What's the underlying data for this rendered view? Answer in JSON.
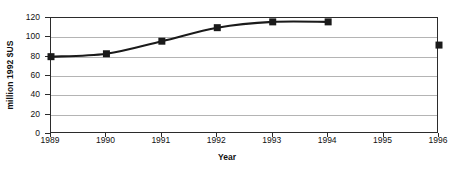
{
  "chart_data": {
    "type": "line",
    "title": "",
    "subtitle": "",
    "xlabel": "Year",
    "ylabel": "million 1992 $US",
    "categories": [
      "1989",
      "1990",
      "1991",
      "1992",
      "1993",
      "1994",
      "1995",
      "1996"
    ],
    "series": [
      {
        "name": "million 1992 $US",
        "values": [
          80,
          83,
          96,
          110,
          116,
          116,
          null,
          92
        ],
        "marker": "filled-square",
        "marker_color": "#1a1a1a",
        "line_color": "#1a1a1a",
        "connected_range": [
          "1989",
          "1994"
        ],
        "isolated_points": [
          "1996"
        ]
      }
    ],
    "ylim": [
      0,
      120
    ],
    "yticks": [
      0,
      20,
      40,
      60,
      80,
      100,
      120
    ],
    "ytick_labels": [
      "0",
      "20",
      "40",
      "60",
      "80",
      "100",
      "120"
    ],
    "grid": "horizontal",
    "gridline_color": "#b4b4b4",
    "frame": true,
    "frame_color": "#2b2b2b",
    "legend": "none",
    "background": "#ffffff"
  },
  "axes": {
    "y_title": "million 1992 $US",
    "x_title": "Year"
  }
}
